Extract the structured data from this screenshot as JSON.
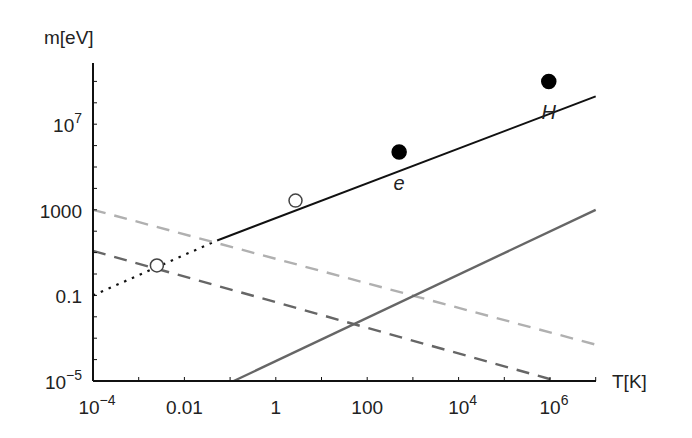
{
  "chart_data": {
    "type": "line",
    "title": "",
    "xlabel": "T[K]",
    "ylabel": "m[eV]",
    "xscale": "log",
    "yscale": "log",
    "xlim": [
      0.0001,
      10000000
    ],
    "ylim": [
      1e-05,
      1000000000
    ],
    "grid": false,
    "legend": "none",
    "x_ticks": [
      {
        "value": 0.0001,
        "base": "10",
        "exp": "−4",
        "label": ""
      },
      {
        "value": 0.01,
        "base": "",
        "exp": "",
        "label": "0.01"
      },
      {
        "value": 1,
        "base": "",
        "exp": "",
        "label": "1"
      },
      {
        "value": 100,
        "base": "",
        "exp": "",
        "label": "100"
      },
      {
        "value": 10000,
        "base": "10",
        "exp": "4",
        "label": ""
      },
      {
        "value": 1000000,
        "base": "10",
        "exp": "6",
        "label": ""
      }
    ],
    "y_ticks": [
      {
        "value": 1e-05,
        "base": "10",
        "exp": "−5",
        "label": ""
      },
      {
        "value": 0.1,
        "base": "",
        "exp": "",
        "label": "0.1"
      },
      {
        "value": 1000,
        "base": "",
        "exp": "",
        "label": "1000"
      },
      {
        "value": 10000000,
        "base": "10",
        "exp": "7",
        "label": ""
      }
    ],
    "series": [
      {
        "name": "black-solid-with-dotted-extension",
        "style": "solid",
        "color": "#111111",
        "dotted_segment": {
          "x": [
            0.0001,
            0.052
          ],
          "y": [
            0.1,
            37
          ]
        },
        "solid_segment": {
          "x": [
            0.052,
            10000000
          ],
          "y": [
            37,
            200000000
          ]
        }
      },
      {
        "name": "light-gray-dashed",
        "style": "dashed",
        "color": "#b0b0b0",
        "x": [
          0.0001,
          10000000
        ],
        "y": [
          1000,
          0.0005
        ]
      },
      {
        "name": "dark-gray-dashed",
        "style": "dashed",
        "color": "#666666",
        "x": [
          0.0001,
          1400000
        ],
        "y": [
          12,
          1e-05
        ]
      },
      {
        "name": "gray-solid",
        "style": "solid",
        "color": "#666666",
        "x": [
          0.12,
          10000000
        ],
        "y": [
          1e-05,
          1000
        ]
      }
    ],
    "markers": [
      {
        "name": "open-circle-low",
        "x": 0.0025,
        "y": 2.5,
        "filled": false,
        "label": ""
      },
      {
        "name": "open-circle-high",
        "x": 2.7,
        "y": 2700,
        "filled": false,
        "label": ""
      },
      {
        "name": "electron",
        "x": 500,
        "y": 500000,
        "filled": true,
        "label": "e"
      },
      {
        "name": "hydrogen",
        "x": 940000,
        "y": 1000000000,
        "filled": true,
        "label": "H"
      }
    ]
  }
}
